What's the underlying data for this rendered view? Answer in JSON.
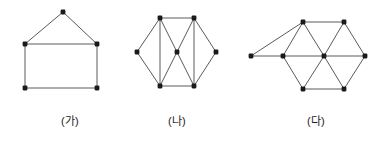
{
  "figure": {
    "background_color": "#ffffff",
    "edge_color": "#5a5a5a",
    "vertex_color": "#1a1a1a",
    "vertex_radius": 2.4,
    "edge_width": 1,
    "width": 387,
    "height": 141
  },
  "diagrams": [
    {
      "id": "ga",
      "label": "(가)",
      "label_x": 70,
      "label_y": 112,
      "vertex_count": 5,
      "edge_count": 6,
      "shape_name": "house-pentagon",
      "vertices": [
        {
          "name": "apex",
          "x": 63,
          "y": 12
        },
        {
          "name": "upper-left",
          "x": 25,
          "y": 44
        },
        {
          "name": "upper-right",
          "x": 97,
          "y": 44
        },
        {
          "name": "lower-left",
          "x": 25,
          "y": 88
        },
        {
          "name": "lower-right",
          "x": 97,
          "y": 88
        }
      ],
      "edges": [
        [
          0,
          1
        ],
        [
          0,
          2
        ],
        [
          1,
          2
        ],
        [
          1,
          3
        ],
        [
          2,
          4
        ],
        [
          3,
          4
        ]
      ]
    },
    {
      "id": "na",
      "label": "(나)",
      "label_x": 177,
      "label_y": 112,
      "vertex_count": 7,
      "edge_count": 12,
      "shape_name": "hexagon-with-center",
      "vertices": [
        {
          "name": "top-left",
          "x": 160,
          "y": 18
        },
        {
          "name": "top-right",
          "x": 194,
          "y": 18
        },
        {
          "name": "mid-left",
          "x": 137,
          "y": 52
        },
        {
          "name": "center",
          "x": 177,
          "y": 52
        },
        {
          "name": "mid-right",
          "x": 216,
          "y": 52
        },
        {
          "name": "bottom-left",
          "x": 160,
          "y": 86
        },
        {
          "name": "bottom-right",
          "x": 194,
          "y": 86
        }
      ],
      "edges": [
        [
          0,
          1
        ],
        [
          0,
          2
        ],
        [
          0,
          3
        ],
        [
          0,
          5
        ],
        [
          1,
          3
        ],
        [
          1,
          4
        ],
        [
          1,
          6
        ],
        [
          2,
          5
        ],
        [
          3,
          5
        ],
        [
          3,
          6
        ],
        [
          4,
          6
        ],
        [
          5,
          6
        ]
      ]
    },
    {
      "id": "da",
      "label": "(다)",
      "label_x": 316,
      "label_y": 112,
      "vertex_count": 8,
      "edge_count": 14,
      "shape_name": "triangular-lattice-with-tail",
      "vertices": [
        {
          "name": "far-left",
          "x": 251,
          "y": 56
        },
        {
          "name": "mid-left",
          "x": 283,
          "y": 56
        },
        {
          "name": "center",
          "x": 324,
          "y": 56
        },
        {
          "name": "mid-right",
          "x": 365,
          "y": 56
        },
        {
          "name": "top-left",
          "x": 303,
          "y": 22
        },
        {
          "name": "top-right",
          "x": 344,
          "y": 22
        },
        {
          "name": "bottom-left",
          "x": 303,
          "y": 89
        },
        {
          "name": "bottom-right",
          "x": 344,
          "y": 89
        }
      ],
      "edges": [
        [
          0,
          1
        ],
        [
          0,
          4
        ],
        [
          1,
          2
        ],
        [
          1,
          4
        ],
        [
          1,
          6
        ],
        [
          2,
          3
        ],
        [
          2,
          4
        ],
        [
          2,
          5
        ],
        [
          2,
          6
        ],
        [
          2,
          7
        ],
        [
          3,
          5
        ],
        [
          3,
          7
        ],
        [
          4,
          5
        ],
        [
          6,
          7
        ]
      ]
    }
  ]
}
